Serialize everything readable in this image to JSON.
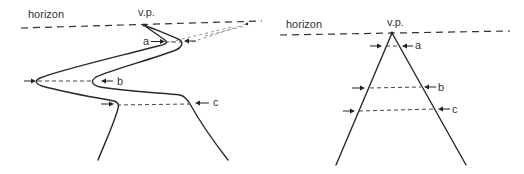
{
  "figure": {
    "left_panel": {
      "name": "winding-road",
      "horizon_label": "horizon",
      "vp_label": "v.p.",
      "markers": [
        {
          "id": "a",
          "label": "a"
        },
        {
          "id": "b",
          "label": "b"
        },
        {
          "id": "c",
          "label": "c"
        }
      ]
    },
    "right_panel": {
      "name": "straight-road",
      "horizon_label": "horizon",
      "vp_label": "v.p.",
      "markers": [
        {
          "id": "a",
          "label": "a"
        },
        {
          "id": "b",
          "label": "b"
        },
        {
          "id": "c",
          "label": "c"
        }
      ]
    }
  },
  "colors": {
    "ink": "#2a2a2a",
    "background": "#ffffff"
  }
}
